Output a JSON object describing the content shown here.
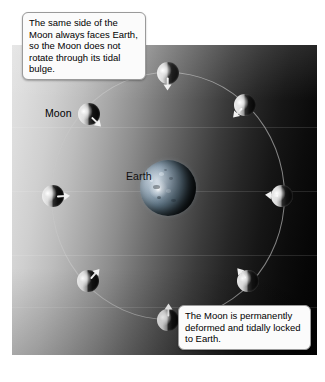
{
  "figure": {
    "title_alt": "Tidal locking of the Moon to Earth",
    "bodies": {
      "earth_label": "Earth",
      "moon_label": "Moon"
    }
  },
  "callouts": [
    {
      "id": "top-left-callout",
      "text": "The same side of the Moon always faces Earth, so the Moon does not rotate through its tidal bulge."
    },
    {
      "id": "bottom-right-callout",
      "text": "The Moon is permanently deformed and tidally locked to Earth."
    }
  ],
  "diagram_data": {
    "type": "diagram",
    "subject": "tidal-locking",
    "panel": {
      "x": 12,
      "y": 45,
      "width": 305,
      "height": 310
    },
    "lighting": {
      "sun_direction": "left",
      "gradient": "light-left-to-dark-right"
    },
    "earth": {
      "cx": 168,
      "cy": 188,
      "r": 28
    },
    "orbit": {
      "cx": 168,
      "cy": 196,
      "rx": 117,
      "ry": 124
    },
    "moons": [
      {
        "name": "moon-top",
        "cx": 168,
        "cy": 73,
        "r": 11,
        "bulge_deg": 90,
        "lit_deg": 100
      },
      {
        "name": "moon-upper-right",
        "cx": 245,
        "cy": 105,
        "r": 11,
        "bulge_deg": 157,
        "lit_deg": 100
      },
      {
        "name": "moon-right",
        "cx": 282,
        "cy": 196,
        "r": 11,
        "bulge_deg": 180,
        "lit_deg": 100
      },
      {
        "name": "moon-lower-right",
        "cx": 248,
        "cy": 281,
        "r": 11,
        "bulge_deg": 222,
        "lit_deg": 100
      },
      {
        "name": "moon-bottom",
        "cx": 168,
        "cy": 320,
        "r": 11,
        "bulge_deg": 270,
        "lit_deg": 100
      },
      {
        "name": "moon-lower-left",
        "cx": 88,
        "cy": 281,
        "r": 11,
        "bulge_deg": 315,
        "lit_deg": 100
      },
      {
        "name": "moon-left",
        "cx": 53,
        "cy": 196,
        "r": 11,
        "bulge_deg": 0,
        "lit_deg": 100
      },
      {
        "name": "moon-upper-left",
        "cx": 89,
        "cy": 114,
        "r": 11,
        "bulge_deg": 45,
        "lit_deg": 100
      }
    ],
    "labels": [
      {
        "name": "moon-label",
        "text": "Moon",
        "x": 45,
        "y": 108
      },
      {
        "name": "earth-label",
        "text": "Earth",
        "x": 126,
        "y": 171
      }
    ],
    "colors": {
      "panel_light": "#e4e4e4",
      "panel_dark": "#030303",
      "orbit_line": "#c8c8c8",
      "callout_bg": "#fbfbfb",
      "callout_border": "#9a9a9a",
      "bulge": "#ffffff"
    }
  }
}
